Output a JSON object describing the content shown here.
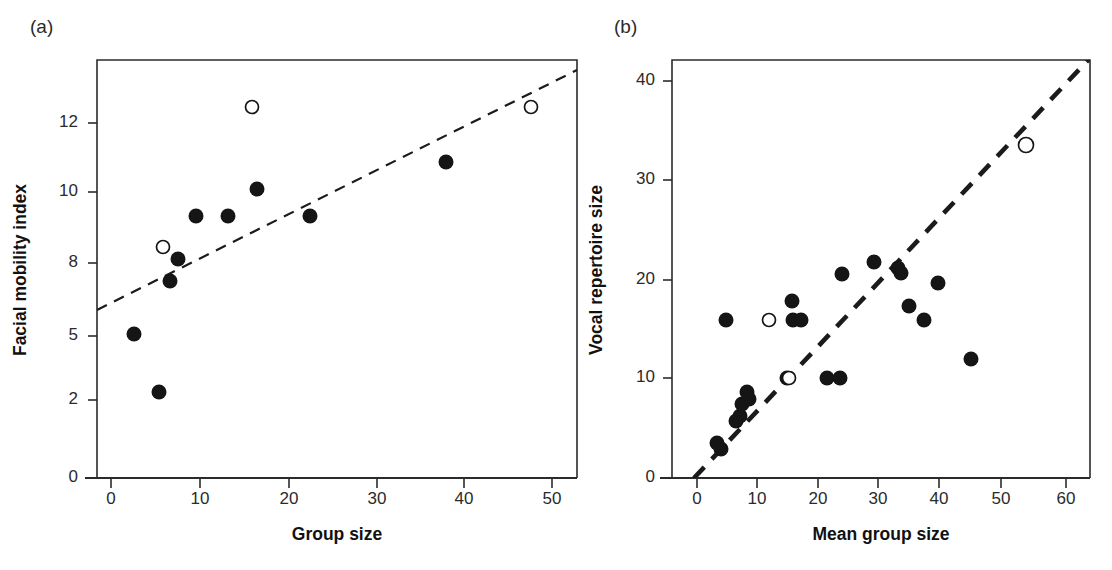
{
  "figure": {
    "width": 1112,
    "height": 570,
    "background": "#ffffff",
    "ink": "#151515"
  },
  "panels": [
    {
      "id": "a",
      "label": "(a)",
      "label_pos": {
        "x": 30,
        "y": 33
      },
      "plot_box": {
        "left": 97,
        "right": 577,
        "top": 60,
        "bottom": 478
      },
      "xaxis": {
        "title": "Group size",
        "title_pos": {
          "x": 337,
          "y": 540
        },
        "ticks": [
          {
            "value": 0,
            "label": "0",
            "px": 111
          },
          {
            "value": 10,
            "label": "10",
            "px": 200
          },
          {
            "value": 20,
            "label": "20",
            "px": 289
          },
          {
            "value": 30,
            "label": "30",
            "px": 377
          },
          {
            "value": 40,
            "label": "40",
            "px": 464
          },
          {
            "value": 50,
            "label": "50",
            "px": 552
          }
        ],
        "range": [
          -3,
          54
        ],
        "label_y": 492
      },
      "yaxis": {
        "title": "Facial mobility index",
        "title_pos": {
          "x": 26,
          "y": 270
        },
        "ticks": [
          {
            "value": 12,
            "label": "12",
            "px": 123
          },
          {
            "value": 10,
            "label": "10",
            "px": 192
          },
          {
            "value": 8,
            "label": "8",
            "px": 263
          },
          {
            "value": 5,
            "label": "5",
            "px": 336
          },
          {
            "value": 2,
            "label": "2",
            "px": 400
          },
          {
            "value": 0,
            "label": "0",
            "px": 478
          }
        ],
        "label_x": 78
      },
      "trendline": {
        "x1": 97,
        "y1": 310,
        "x2": 577,
        "y2": 70,
        "style": "dashed-thin"
      },
      "points": [
        {
          "cx": 134,
          "cy": 334,
          "r": 7.5,
          "type": "filled"
        },
        {
          "cx": 159,
          "cy": 392,
          "r": 7.5,
          "type": "filled"
        },
        {
          "cx": 163,
          "cy": 247,
          "r": 6.5,
          "type": "open"
        },
        {
          "cx": 170,
          "cy": 281,
          "r": 7.5,
          "type": "filled"
        },
        {
          "cx": 178,
          "cy": 259,
          "r": 7.5,
          "type": "filled"
        },
        {
          "cx": 196,
          "cy": 216,
          "r": 7.5,
          "type": "filled"
        },
        {
          "cx": 228,
          "cy": 216,
          "r": 7.5,
          "type": "filled"
        },
        {
          "cx": 252,
          "cy": 107,
          "r": 6.5,
          "type": "open"
        },
        {
          "cx": 257,
          "cy": 189,
          "r": 7.5,
          "type": "filled"
        },
        {
          "cx": 310,
          "cy": 216,
          "r": 7.5,
          "type": "filled"
        },
        {
          "cx": 446,
          "cy": 162,
          "r": 7.5,
          "type": "filled"
        },
        {
          "cx": 531,
          "cy": 107,
          "r": 6.5,
          "type": "open"
        }
      ]
    },
    {
      "id": "b",
      "label": "(b)",
      "label_pos": {
        "x": 614,
        "y": 33
      },
      "plot_box": {
        "left": 672,
        "right": 1090,
        "top": 60,
        "bottom": 478
      },
      "xaxis": {
        "title": "Mean group size",
        "title_pos": {
          "x": 881,
          "y": 540
        },
        "ticks": [
          {
            "value": 0,
            "label": "0",
            "px": 697
          },
          {
            "value": 10,
            "label": "10",
            "px": 757
          },
          {
            "value": 20,
            "label": "20",
            "px": 818
          },
          {
            "value": 30,
            "label": "30",
            "px": 878
          },
          {
            "value": 40,
            "label": "40",
            "px": 939
          },
          {
            "value": 50,
            "label": "50",
            "px": 1001
          },
          {
            "value": 60,
            "label": "60",
            "px": 1066
          }
        ],
        "range": [
          -4,
          64
        ],
        "label_y": 492
      },
      "yaxis": {
        "title": "Vocal repertoire size",
        "title_pos": {
          "x": 602,
          "y": 270
        },
        "ticks": [
          {
            "value": 40,
            "label": "40",
            "px": 81
          },
          {
            "value": 30,
            "label": "30",
            "px": 180
          },
          {
            "value": 20,
            "label": "20",
            "px": 280
          },
          {
            "value": 10,
            "label": "10",
            "px": 378
          },
          {
            "value": 0,
            "label": "0",
            "px": 478
          }
        ],
        "label_x": 655
      },
      "trendline": {
        "x1": 694,
        "y1": 478,
        "x2": 1090,
        "y2": 58,
        "style": "dashed-thick"
      },
      "points": [
        {
          "cx": 717,
          "cy": 443,
          "r": 7.5,
          "type": "filled"
        },
        {
          "cx": 721,
          "cy": 449,
          "r": 7.5,
          "type": "filled"
        },
        {
          "cx": 726,
          "cy": 320,
          "r": 7.5,
          "type": "filled"
        },
        {
          "cx": 736,
          "cy": 421,
          "r": 7.5,
          "type": "filled"
        },
        {
          "cx": 740,
          "cy": 416,
          "r": 7.5,
          "type": "filled"
        },
        {
          "cx": 742,
          "cy": 404,
          "r": 7.5,
          "type": "filled"
        },
        {
          "cx": 747,
          "cy": 392,
          "r": 7.5,
          "type": "filled"
        },
        {
          "cx": 749,
          "cy": 399,
          "r": 7.5,
          "type": "filled"
        },
        {
          "cx": 769,
          "cy": 320,
          "r": 6.5,
          "type": "open"
        },
        {
          "cx": 787,
          "cy": 378,
          "r": 7.5,
          "type": "filled"
        },
        {
          "cx": 789,
          "cy": 378,
          "r": 6.5,
          "type": "open"
        },
        {
          "cx": 792,
          "cy": 301,
          "r": 7.5,
          "type": "filled"
        },
        {
          "cx": 793,
          "cy": 320,
          "r": 7.5,
          "type": "filled"
        },
        {
          "cx": 801,
          "cy": 320,
          "r": 7.5,
          "type": "filled"
        },
        {
          "cx": 827,
          "cy": 378,
          "r": 7.5,
          "type": "filled"
        },
        {
          "cx": 842,
          "cy": 274,
          "r": 7.5,
          "type": "filled"
        },
        {
          "cx": 840,
          "cy": 378,
          "r": 7.5,
          "type": "filled"
        },
        {
          "cx": 874,
          "cy": 262,
          "r": 7.5,
          "type": "filled"
        },
        {
          "cx": 898,
          "cy": 268,
          "r": 7.5,
          "type": "filled"
        },
        {
          "cx": 901,
          "cy": 273,
          "r": 7.5,
          "type": "filled"
        },
        {
          "cx": 938,
          "cy": 283,
          "r": 7.5,
          "type": "filled"
        },
        {
          "cx": 909,
          "cy": 306,
          "r": 7.5,
          "type": "filled"
        },
        {
          "cx": 924,
          "cy": 320,
          "r": 7.5,
          "type": "filled"
        },
        {
          "cx": 971,
          "cy": 359,
          "r": 7.5,
          "type": "filled"
        },
        {
          "cx": 1026,
          "cy": 145,
          "r": 7.5,
          "type": "open"
        }
      ]
    }
  ],
  "chart_data": [
    {
      "type": "scatter",
      "panel": "a",
      "title": "(a)",
      "xlabel": "Group size",
      "ylabel": "Facial mobility index",
      "xlim": [
        -3,
        54
      ],
      "ylim": [
        0,
        13.5
      ],
      "xticks": [
        0,
        10,
        20,
        30,
        40,
        50
      ],
      "yticks": [
        0,
        2,
        5,
        8,
        10,
        12
      ],
      "grid": false,
      "legend": false,
      "note": "y-axis tick labels are unevenly valued (0,2,5,8,10,12) but evenly spaced on the printed axis; point values below are read against the 8-10-12 linear spacing",
      "series": [
        {
          "name": "filled circles",
          "marker": "filled-circle",
          "points": [
            {
              "x": 2.6,
              "y": 5.0
            },
            {
              "x": 5.4,
              "y": 2.4
            },
            {
              "x": 6.6,
              "y": 7.6
            },
            {
              "x": 7.5,
              "y": 8.4
            },
            {
              "x": 10.0,
              "y": 9.2
            },
            {
              "x": 13.6,
              "y": 9.2
            },
            {
              "x": 16.4,
              "y": 10.0
            },
            {
              "x": 22.7,
              "y": 9.2
            },
            {
              "x": 37.9,
              "y": 10.8
            }
          ]
        },
        {
          "name": "open circles",
          "marker": "open-circle",
          "points": [
            {
              "x": 5.4,
              "y": 8.4
            },
            {
              "x": 15.8,
              "y": 12.4
            },
            {
              "x": 47.9,
              "y": 12.4
            }
          ]
        }
      ],
      "trendline": {
        "style": "dashed",
        "x": [
          -3,
          54
        ],
        "y": [
          6.7,
          13.2
        ]
      }
    },
    {
      "type": "scatter",
      "panel": "b",
      "title": "(b)",
      "xlabel": "Mean group size",
      "ylabel": "Vocal repertoire size",
      "xlim": [
        -4,
        64
      ],
      "ylim": [
        0,
        42
      ],
      "xticks": [
        0,
        10,
        20,
        30,
        40,
        50,
        60
      ],
      "yticks": [
        0,
        10,
        20,
        30,
        40
      ],
      "grid": false,
      "legend": false,
      "series": [
        {
          "name": "filled circles",
          "marker": "filled-circle",
          "points": [
            {
              "x": 3.3,
              "y": 3.5
            },
            {
              "x": 3.9,
              "y": 2.9
            },
            {
              "x": 4.7,
              "y": 16.0
            },
            {
              "x": 6.3,
              "y": 5.7
            },
            {
              "x": 7.0,
              "y": 6.2
            },
            {
              "x": 7.3,
              "y": 7.5
            },
            {
              "x": 8.1,
              "y": 8.6
            },
            {
              "x": 8.5,
              "y": 8.0
            },
            {
              "x": 14.6,
              "y": 10.0
            },
            {
              "x": 15.4,
              "y": 18.0
            },
            {
              "x": 15.6,
              "y": 16.0
            },
            {
              "x": 16.9,
              "y": 16.0
            },
            {
              "x": 21.1,
              "y": 10.0
            },
            {
              "x": 23.6,
              "y": 20.5
            },
            {
              "x": 23.3,
              "y": 10.0
            },
            {
              "x": 28.8,
              "y": 22.0
            },
            {
              "x": 32.7,
              "y": 21.5
            },
            {
              "x": 33.2,
              "y": 21.0
            },
            {
              "x": 39.2,
              "y": 19.5
            },
            {
              "x": 34.5,
              "y": 17.0
            },
            {
              "x": 37.0,
              "y": 16.0
            },
            {
              "x": 44.6,
              "y": 12.0
            }
          ]
        },
        {
          "name": "open circles",
          "marker": "open-circle",
          "points": [
            {
              "x": 11.8,
              "y": 16.0
            },
            {
              "x": 15.1,
              "y": 10.0
            },
            {
              "x": 53.6,
              "y": 33.5
            }
          ]
        }
      ],
      "trendline": {
        "style": "dashed-thick",
        "x": [
          -0.5,
          64
        ],
        "y": [
          0,
          42.3
        ]
      }
    }
  ]
}
